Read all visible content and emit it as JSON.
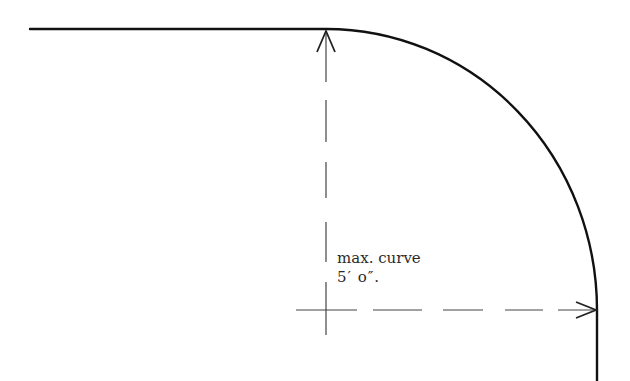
{
  "diagram": {
    "label": {
      "line1": "max. curve",
      "line2": "5′ o″."
    },
    "colors": {
      "outline": "#111111",
      "dimension": "#444444",
      "text": "#2a2a2a",
      "background": "#ffffff"
    },
    "elements": {
      "outline": "straight edge turning into a quarter-circle curve then vertical edge",
      "vertical_dimension": "dashed line with arrow pointing up to the tangent point",
      "horizontal_dimension": "dashed line with arrow pointing right to the vertical edge"
    }
  }
}
